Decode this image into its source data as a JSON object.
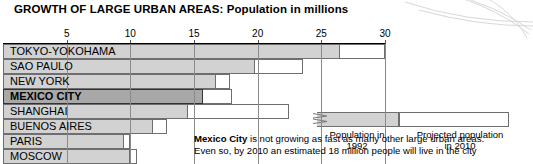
{
  "title": "GROWTH OF LARGE URBAN AREAS: Population in millions",
  "chart_data": {
    "type": "bar",
    "title": "GROWTH OF LARGE URBAN AREAS: Population in millions",
    "xlabel": "Population in millions",
    "ylabel": "",
    "orientation": "horizontal",
    "stacked": true,
    "xlim": [
      0,
      30
    ],
    "ticks": [
      5,
      10,
      15,
      20,
      25,
      30
    ],
    "tick_labels": [
      "5",
      "10",
      "15",
      "20",
      "25",
      "30"
    ],
    "grid": true,
    "legend_position": "inside-right",
    "categories": [
      "TOKYO-YOKOHAMA",
      "SAO PAULO",
      "NEW YORK",
      "MEXICO CITY",
      "SHANGHAI",
      "BUENOS AIRES",
      "PARIS",
      "MOSCOW"
    ],
    "series": [
      {
        "name": "Population in 1992",
        "values": [
          26.5,
          19.8,
          16.7,
          15.7,
          14.5,
          11.8,
          9.5,
          10.0
        ]
      },
      {
        "name": "Projected population in 2010",
        "values": [
          30.0,
          23.6,
          17.8,
          18.0,
          22.5,
          12.9,
          10.0,
          10.5
        ]
      }
    ],
    "highlighted_category": "MEXICO CITY",
    "annotations": [
      "Mexico City is not growing as fast as many other large urban areas.",
      "Even so, by 2010 an estimated 18 million people will live in the city"
    ]
  },
  "legend": {
    "past": {
      "line1": "Population in",
      "line2": "1992"
    },
    "future": {
      "line1": "Projected population",
      "line2": "in 2010"
    }
  },
  "note": {
    "bold_lead": "Mexico City",
    "line1_rest": " is not growing as fast as many other large urban areas.",
    "line2": "Even so, by 2010 an estimated 18 million people will live in the city"
  }
}
